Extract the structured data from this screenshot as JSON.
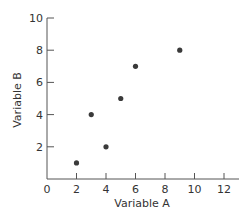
{
  "chart_data": {
    "type": "scatter",
    "title": "",
    "xlabel": "Variable A",
    "ylabel": "Variable B",
    "xlim": [
      0,
      12
    ],
    "ylim": [
      0,
      10
    ],
    "x_ticks": [
      0,
      2,
      4,
      6,
      8,
      10,
      12
    ],
    "y_ticks": [
      2,
      4,
      6,
      8,
      10
    ],
    "grid": false,
    "legend": null,
    "series": [
      {
        "name": "points",
        "color": "#3a3a3a",
        "points": [
          {
            "x": 2,
            "y": 1
          },
          {
            "x": 3,
            "y": 4
          },
          {
            "x": 4,
            "y": 2
          },
          {
            "x": 5,
            "y": 5
          },
          {
            "x": 6,
            "y": 7
          },
          {
            "x": 9,
            "y": 8
          }
        ]
      }
    ]
  },
  "colors": {
    "axis": "#555555",
    "text": "#333333",
    "marker": "#3a3a3a"
  }
}
